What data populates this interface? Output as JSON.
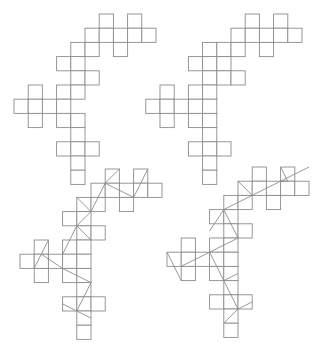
{
  "diagram": {
    "type": "polyomino-nets",
    "cell_size": 14.2,
    "stroke_color": "#8c8c8c",
    "background": "#ffffff",
    "figures": [
      {
        "name": "net-top-left",
        "origin": [
          14,
          14
        ],
        "cells": [
          [
            6,
            0
          ],
          [
            8,
            0
          ],
          [
            5,
            1
          ],
          [
            6,
            1
          ],
          [
            7,
            1
          ],
          [
            8,
            1
          ],
          [
            9,
            1
          ],
          [
            4,
            2
          ],
          [
            5,
            2
          ],
          [
            7,
            2
          ],
          [
            3,
            3
          ],
          [
            4,
            3
          ],
          [
            4,
            4
          ],
          [
            5,
            4
          ],
          [
            1,
            5
          ],
          [
            3,
            5
          ],
          [
            4,
            5
          ],
          [
            0,
            6
          ],
          [
            1,
            6
          ],
          [
            2,
            6
          ],
          [
            3,
            6
          ],
          [
            1,
            7
          ],
          [
            3,
            7
          ],
          [
            4,
            7
          ],
          [
            4,
            8
          ],
          [
            3,
            9
          ],
          [
            4,
            9
          ],
          [
            5,
            9
          ],
          [
            4,
            10
          ],
          [
            4,
            11
          ]
        ],
        "diagonals": []
      },
      {
        "name": "net-top-right",
        "origin": [
          160,
          14
        ],
        "cells": [
          [
            6,
            0
          ],
          [
            8,
            0
          ],
          [
            5,
            1
          ],
          [
            6,
            1
          ],
          [
            7,
            1
          ],
          [
            8,
            1
          ],
          [
            9,
            1
          ],
          [
            3,
            2
          ],
          [
            4,
            2
          ],
          [
            5,
            2
          ],
          [
            7,
            2
          ],
          [
            2,
            3
          ],
          [
            3,
            3
          ],
          [
            4,
            3
          ],
          [
            3,
            4
          ],
          [
            4,
            4
          ],
          [
            5,
            4
          ],
          [
            0,
            5
          ],
          [
            2,
            5
          ],
          [
            3,
            5
          ],
          [
            -1,
            6
          ],
          [
            0,
            6
          ],
          [
            1,
            6
          ],
          [
            2,
            6
          ],
          [
            3,
            6
          ],
          [
            0,
            7
          ],
          [
            2,
            7
          ],
          [
            3,
            7
          ],
          [
            3,
            8
          ],
          [
            2,
            9
          ],
          [
            3,
            9
          ],
          [
            4,
            9
          ],
          [
            3,
            10
          ],
          [
            3,
            11
          ]
        ],
        "diagonals": []
      },
      {
        "name": "net-bottom-left",
        "origin": [
          20,
          169
        ],
        "cells": [
          [
            6,
            0
          ],
          [
            8,
            0
          ],
          [
            5,
            1
          ],
          [
            6,
            1
          ],
          [
            7,
            1
          ],
          [
            8,
            1
          ],
          [
            9,
            1
          ],
          [
            4,
            2
          ],
          [
            5,
            2
          ],
          [
            7,
            2
          ],
          [
            3,
            3
          ],
          [
            4,
            3
          ],
          [
            4,
            4
          ],
          [
            5,
            4
          ],
          [
            1,
            5
          ],
          [
            3,
            5
          ],
          [
            4,
            5
          ],
          [
            0,
            6
          ],
          [
            1,
            6
          ],
          [
            2,
            6
          ],
          [
            3,
            6
          ],
          [
            4,
            6
          ],
          [
            1,
            7
          ],
          [
            3,
            7
          ],
          [
            4,
            7
          ],
          [
            4,
            8
          ],
          [
            3,
            9
          ],
          [
            4,
            9
          ],
          [
            5,
            9
          ],
          [
            4,
            10
          ],
          [
            4,
            11
          ]
        ],
        "diagonals": [
          [
            [
              7,
              0
            ],
            [
              6,
              1
            ],
            [
              5,
              3
            ],
            [
              4,
              4
            ],
            [
              3,
              6
            ]
          ],
          [
            [
              9,
              0
            ],
            [
              8,
              2
            ]
          ],
          [
            [
              6,
              1
            ],
            [
              8,
              2
            ]
          ],
          [
            [
              4,
              2
            ],
            [
              5,
              3
            ]
          ],
          [
            [
              4,
              4
            ],
            [
              5,
              5
            ]
          ],
          [
            [
              2,
              5
            ],
            [
              1.5,
              6
            ],
            [
              1,
              7
            ]
          ],
          [
            [
              1.5,
              6
            ],
            [
              3,
              7
            ],
            [
              5,
              8
            ]
          ],
          [
            [
              5,
              8
            ],
            [
              4,
              10
            ]
          ],
          [
            [
              3,
              9.5
            ],
            [
              4,
              10
            ],
            [
              5,
              10.5
            ]
          ]
        ]
      },
      {
        "name": "net-bottom-right",
        "origin": [
          167,
          167
        ],
        "cells": [
          [
            6,
            0
          ],
          [
            8,
            0
          ],
          [
            5,
            1
          ],
          [
            6,
            1
          ],
          [
            7,
            1
          ],
          [
            8,
            1
          ],
          [
            9,
            1
          ],
          [
            4,
            2
          ],
          [
            5,
            2
          ],
          [
            7,
            2
          ],
          [
            3,
            3
          ],
          [
            4,
            3
          ],
          [
            4,
            4
          ],
          [
            5,
            4
          ],
          [
            1,
            5
          ],
          [
            3,
            5
          ],
          [
            4,
            5
          ],
          [
            0,
            6
          ],
          [
            1,
            6
          ],
          [
            2,
            6
          ],
          [
            3,
            6
          ],
          [
            4,
            6
          ],
          [
            1,
            7
          ],
          [
            3,
            7
          ],
          [
            4,
            7
          ],
          [
            4,
            8
          ],
          [
            3,
            9
          ],
          [
            4,
            9
          ],
          [
            5,
            9
          ],
          [
            4,
            10
          ],
          [
            4,
            11
          ]
        ],
        "diagonals": [
          [
            [
              3,
              4.5
            ],
            [
              4,
              3
            ],
            [
              6,
              2
            ],
            [
              8,
              1
            ],
            [
              10,
              0
            ]
          ],
          [
            [
              5,
              1
            ],
            [
              6,
              2
            ]
          ],
          [
            [
              8,
              0
            ],
            [
              8.5,
              1
            ],
            [
              8,
              1
            ]
          ],
          [
            [
              4,
              3
            ],
            [
              5,
              5
            ]
          ],
          [
            [
              5,
              5
            ],
            [
              3,
              6
            ],
            [
              1,
              7
            ]
          ],
          [
            [
              0,
              6
            ],
            [
              1,
              8
            ]
          ],
          [
            [
              3,
              6
            ],
            [
              4,
              8
            ],
            [
              5,
              10
            ]
          ],
          [
            [
              4,
              8
            ],
            [
              5,
              7.5
            ]
          ],
          [
            [
              5,
              10
            ],
            [
              6,
              9.5
            ]
          ],
          [
            [
              4,
              11
            ],
            [
              5,
              10
            ]
          ]
        ]
      }
    ]
  }
}
